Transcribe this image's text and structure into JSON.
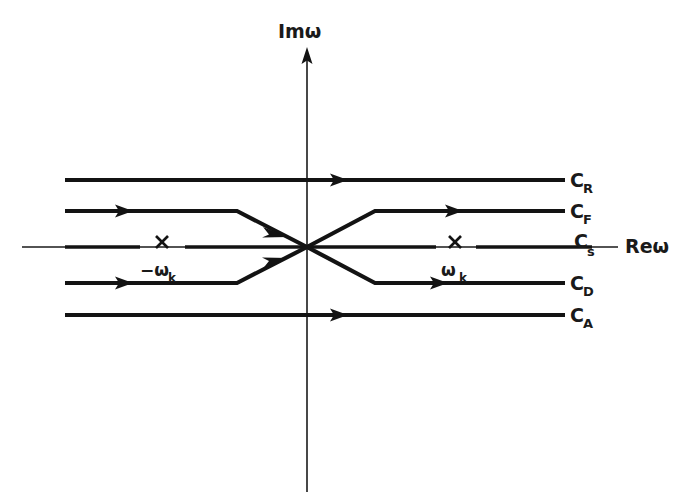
{
  "figure": {
    "type": "complex-plane-contour-diagram",
    "axes": {
      "vertical": {
        "label": "Imω",
        "name": "imaginary-axis",
        "label_x": 278,
        "label_y": 38,
        "x": 307,
        "y_top": 52,
        "y_bottom": 492,
        "arrow": "up"
      },
      "horizontal": {
        "label": "Reω",
        "name": "real-axis",
        "label_x": 625,
        "label_y": 253,
        "y": 247,
        "x_left": 22,
        "x_right": 618,
        "arrow": "none"
      }
    },
    "poles": [
      {
        "name": "pole-negative-omega-k",
        "marker": "x",
        "label_main": "−ω",
        "label_sub": "k",
        "x": 162,
        "y": 247,
        "label_x": 143,
        "label_y": 276
      },
      {
        "name": "pole-positive-omega-k",
        "marker": "x",
        "label_main": "ω",
        "label_sub": "k",
        "x": 455,
        "y": 247,
        "label_x": 443,
        "label_y": 276
      }
    ],
    "contours": [
      {
        "id": "CR",
        "label_main": "C",
        "label_sub": "R",
        "name": "contour-c-r",
        "y": 180,
        "label_x": 570,
        "label_y": 187,
        "arrow_x": 340,
        "shape": "straight",
        "direction": "rightward"
      },
      {
        "id": "CF",
        "label_main": "C",
        "label_sub": "F",
        "name": "contour-c-f",
        "y": 211,
        "label_x": 570,
        "label_y": 218,
        "arrow_x": 125,
        "arrow_x2": 455,
        "bend_left_x": 237,
        "bend_right_x": 375,
        "shape": "descending-through-origin",
        "direction": "rightward"
      },
      {
        "id": "Cs",
        "label_main": "C",
        "label_sub": "s",
        "name": "contour-c-s",
        "y": 247,
        "label_x": 578,
        "label_y": 250,
        "shape": "straight-on-real-axis",
        "direction": "rightward"
      },
      {
        "id": "CD",
        "label_main": "C",
        "label_sub": "D",
        "name": "contour-c-d",
        "y": 283,
        "label_x": 570,
        "label_y": 290,
        "arrow_x": 125,
        "arrow_x2": 440,
        "bend_left_x": 237,
        "bend_right_x": 375,
        "shape": "ascending-through-origin",
        "direction": "rightward"
      },
      {
        "id": "CA",
        "label_main": "C",
        "label_sub": "A",
        "name": "contour-c-a",
        "y": 315,
        "label_x": 570,
        "label_y": 322,
        "arrow_x": 340,
        "shape": "straight",
        "direction": "rightward"
      }
    ],
    "geometry": {
      "x_start": 65,
      "x_end": 565,
      "origin_x": 307,
      "origin_y": 247
    },
    "colors": {
      "ink": "#131313",
      "axis": "#1a1a1a",
      "background": "#ffffff"
    }
  }
}
